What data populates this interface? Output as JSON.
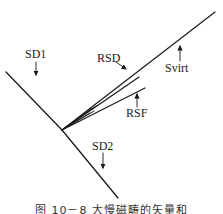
{
  "diagram": {
    "labels": {
      "sd1": "SD1",
      "sd2": "SD2",
      "rsd": "RSD",
      "rsf": "RSF",
      "svirt": "Svirt"
    },
    "caption": "图 10－8  大慢磁畴的矢量和",
    "colors": {
      "line": "#1a1a1a",
      "background": "#ffffff"
    }
  }
}
